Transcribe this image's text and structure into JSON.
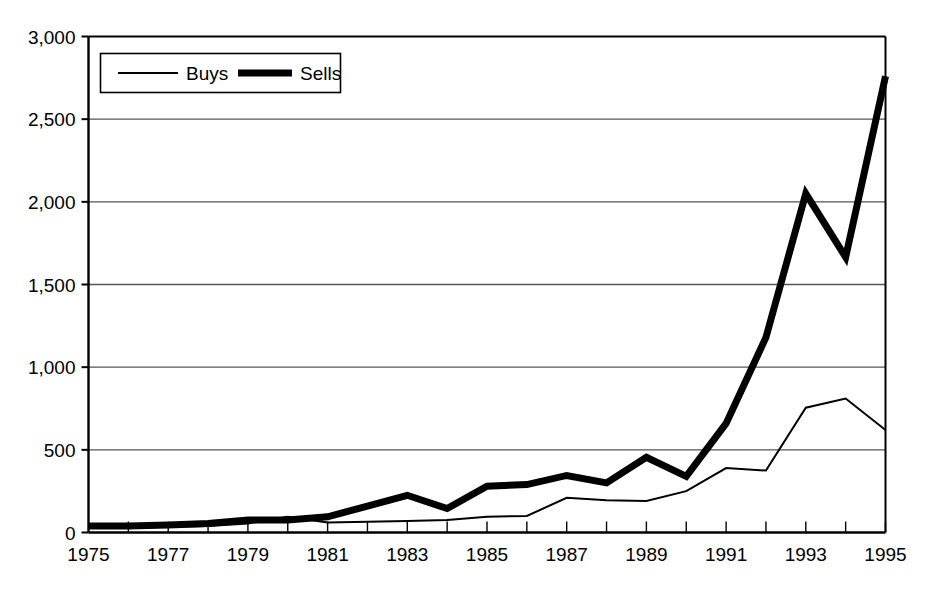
{
  "chart_data": {
    "type": "line",
    "title": "",
    "subtitle": "",
    "xlabel": "",
    "ylabel": "",
    "grid": true,
    "legend_position": "top-left",
    "xlim": [
      1975,
      1995
    ],
    "ylim": [
      0,
      3000
    ],
    "x": [
      1975,
      1976,
      1977,
      1978,
      1979,
      1980,
      1981,
      1982,
      1983,
      1984,
      1985,
      1986,
      1987,
      1988,
      1989,
      1990,
      1991,
      1992,
      1993,
      1994,
      1995
    ],
    "categories": [
      "1975",
      "1976",
      "1977",
      "1978",
      "1979",
      "1980",
      "1981",
      "1982",
      "1983",
      "1984",
      "1985",
      "1986",
      "1987",
      "1988",
      "1989",
      "1990",
      "1991",
      "1992",
      "1993",
      "1994",
      "1995"
    ],
    "xticklabels": [
      "1975",
      "",
      "1977",
      "",
      "1979",
      "",
      "1981",
      "",
      "1983",
      "",
      "1985",
      "",
      "1987",
      "",
      "1989",
      "",
      "1991",
      "",
      "1993",
      "",
      "1995"
    ],
    "xticklabels_shown": [
      "1975",
      "1977",
      "1979",
      "1981",
      "1983",
      "1985",
      "1987",
      "1989",
      "1991",
      "1993",
      "1995"
    ],
    "yticks": [
      0,
      500,
      1000,
      1500,
      2000,
      2500,
      3000
    ],
    "yticklabels": [
      "0",
      "500",
      "1,000",
      "1,500",
      "2,000",
      "2,500",
      "3,000"
    ],
    "series": [
      {
        "name": "Buys",
        "style": "thin-line",
        "color": "#000000",
        "linewidth": 2,
        "values": [
          30,
          30,
          35,
          40,
          55,
          95,
          60,
          65,
          70,
          75,
          95,
          100,
          210,
          195,
          190,
          250,
          390,
          375,
          755,
          810,
          620
        ]
      },
      {
        "name": "Sells",
        "style": "thick-line",
        "color": "#000000",
        "linewidth": 7,
        "values": [
          40,
          40,
          45,
          55,
          75,
          75,
          95,
          160,
          225,
          145,
          280,
          290,
          345,
          300,
          455,
          340,
          660,
          1180,
          2050,
          1665,
          2760
        ]
      }
    ]
  },
  "legend": {
    "items": [
      {
        "label": "Buys",
        "style": "thin-line"
      },
      {
        "label": "Sells",
        "style": "thick-line"
      }
    ]
  },
  "axes": {
    "y_tick_labels": [
      "3,000",
      "2,500",
      "2,000",
      "1,500",
      "1,000",
      "500",
      "0"
    ],
    "x_tick_labels": [
      "1975",
      "1977",
      "1979",
      "1981",
      "1983",
      "1985",
      "1987",
      "1989",
      "1991",
      "1993",
      "1995"
    ]
  },
  "colors": {
    "line": "#000000",
    "grid": "#555555",
    "axis": "#000000",
    "background": "#ffffff"
  }
}
